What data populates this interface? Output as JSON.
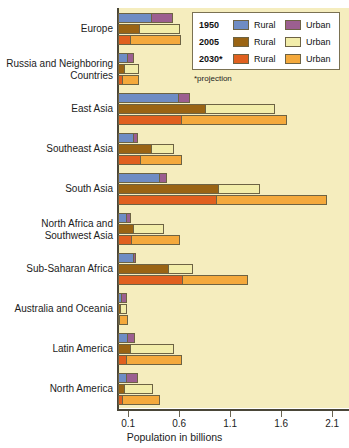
{
  "chart_data": {
    "type": "bar",
    "orientation": "horizontal",
    "title": "",
    "xlabel": "Population in billions",
    "ylabel": "",
    "xlim": [
      0,
      2.1
    ],
    "xticks": [
      0.1,
      0.6,
      1.1,
      1.6,
      2.1
    ],
    "xticklabels": [
      "0.1",
      "0.6",
      "1.1",
      "1.6",
      "2.1"
    ],
    "grid": false,
    "legend_position": "top-right",
    "stacked": true,
    "note": "*projection",
    "categories": [
      "Europe",
      "Russia and Neighboring Countries",
      "East Asia",
      "Southeast Asia",
      "South Asia",
      "North Africa and Southwest Asia",
      "Sub-Saharan Africa",
      "Australia and Oceania",
      "Latin America",
      "North America"
    ],
    "series": [
      {
        "name": "1950 Rural",
        "year": "1950",
        "type": "Rural",
        "color": "#6f8cc4",
        "values": [
          0.33,
          0.1,
          0.6,
          0.16,
          0.41,
          0.09,
          0.16,
          0.04,
          0.1,
          0.09
        ]
      },
      {
        "name": "1950 Urban",
        "year": "1950",
        "type": "Urban",
        "color": "#9c5f90",
        "values": [
          0.21,
          0.06,
          0.11,
          0.04,
          0.07,
          0.04,
          0.02,
          0.05,
          0.07,
          0.11
        ]
      },
      {
        "name": "2005 Rural",
        "year": "2005",
        "type": "Rural",
        "color": "#9a6414",
        "values": [
          0.22,
          0.07,
          0.86,
          0.33,
          0.99,
          0.16,
          0.5,
          0.03,
          0.13,
          0.07
        ]
      },
      {
        "name": "2005 Urban",
        "year": "2005",
        "type": "Urban",
        "color": "#f2edaa",
        "values": [
          0.39,
          0.14,
          0.68,
          0.22,
          0.4,
          0.29,
          0.24,
          0.06,
          0.42,
          0.27
        ]
      },
      {
        "name": "2030 Rural",
        "year": "2030",
        "type": "Rural",
        "color": "#e0601f",
        "values": [
          0.13,
          0.05,
          0.63,
          0.23,
          0.97,
          0.14,
          0.64,
          0.02,
          0.09,
          0.05
        ]
      },
      {
        "name": "2030 Urban",
        "year": "2030",
        "type": "Urban",
        "color": "#f4a93c",
        "values": [
          0.49,
          0.16,
          1.03,
          0.4,
          1.08,
          0.47,
          0.63,
          0.08,
          0.54,
          0.36
        ]
      }
    ],
    "totals_by_year": {
      "1950": [
        0.54,
        0.16,
        0.71,
        0.2,
        0.48,
        0.13,
        0.18,
        0.09,
        0.17,
        0.2
      ],
      "2005": [
        0.61,
        0.21,
        1.54,
        0.55,
        1.39,
        0.45,
        0.74,
        0.09,
        0.55,
        0.34
      ],
      "2030": [
        0.62,
        0.21,
        1.66,
        0.63,
        2.05,
        0.61,
        1.27,
        0.1,
        0.63,
        0.41
      ]
    }
  },
  "legend": {
    "rows": [
      {
        "year": "1950",
        "rural_label": "Rural",
        "urban_label": "Urban",
        "rural_color": "#6f8cc4",
        "urban_color": "#9c5f90"
      },
      {
        "year": "2005",
        "rural_label": "Rural",
        "urban_label": "Urban",
        "rural_color": "#9a6414",
        "urban_color": "#f2edaa"
      },
      {
        "year": "2030*",
        "rural_label": "Rural",
        "urban_label": "Urban",
        "rural_color": "#e0601f",
        "urban_color": "#f4a93c"
      }
    ],
    "note": "*projection"
  },
  "colors": {
    "plot_background": "#f5edbe",
    "axis": "#4a4638",
    "bar_outline": "#6d6344",
    "page_background": "#ffffff"
  }
}
